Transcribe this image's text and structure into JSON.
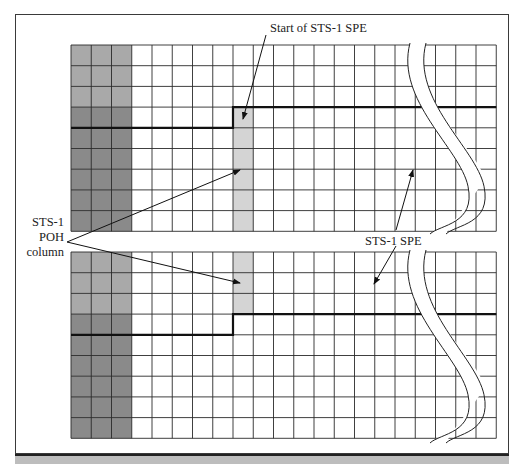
{
  "diagram": {
    "labels": {
      "start_spe": "Start of STS-1 SPE",
      "poh_column_lines": [
        "STS-1",
        "POH",
        "column"
      ],
      "sts1_spe": "STS-1 SPE"
    },
    "frames": [
      {
        "name": "frame-1",
        "rows": 9,
        "columns": 21,
        "overhead_columns": 3,
        "poh_column_index": 8,
        "poh_rows": [
          3,
          4,
          5,
          6,
          7,
          8
        ],
        "spe_boundary_row_left": 4,
        "spe_boundary_row_right": 3
      },
      {
        "name": "frame-2",
        "rows": 9,
        "columns": 21,
        "overhead_columns": 3,
        "poh_column_index": 8,
        "poh_rows": [
          0,
          1,
          2
        ],
        "spe_boundary_row_left": 4,
        "spe_boundary_row_right": 3
      }
    ],
    "colors": {
      "overhead_light": "#a9a9a9",
      "overhead_dark": "#8a8a8a",
      "poh_column": "#d4d4d4",
      "grid_line": "#2a2a2a",
      "band": "#bdbdbd"
    }
  }
}
